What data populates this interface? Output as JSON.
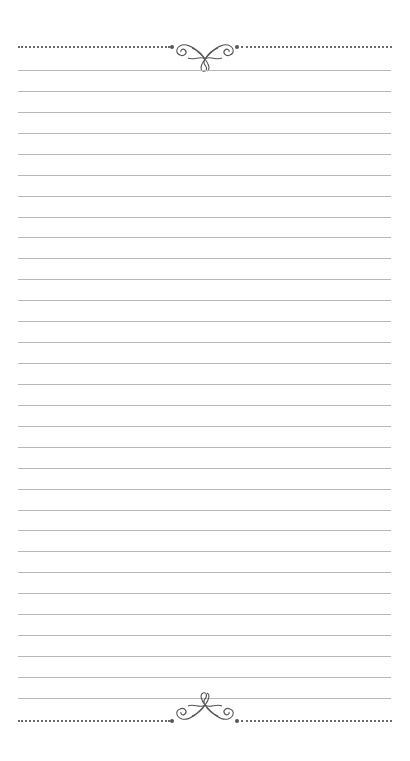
{
  "page": {
    "type": "lined-notepaper",
    "background": "#ffffff",
    "line_color": "#b8b8b8",
    "ornament_color": "#555555",
    "line_count": 31,
    "first_line_y": 70,
    "line_spacing": 20.93,
    "line_left": 18,
    "line_width": 373
  },
  "header": {
    "ornament": "flourish-ornament",
    "divider": "dotted-line"
  },
  "footer": {
    "ornament": "flourish-ornament-flipped",
    "divider": "dotted-line"
  }
}
